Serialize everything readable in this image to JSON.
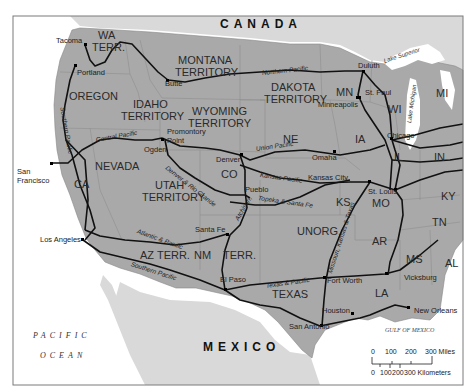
{
  "map": {
    "title": "Railroads of the Western United States",
    "countries": {
      "canada": "CANADA",
      "mexico": "MEXICO"
    },
    "water": {
      "pacific_line1": "PACIFIC",
      "pacific_line2": "OCEAN",
      "gulf": "GULF OF MEXICO",
      "lake_superior": "Lake Superior",
      "lake_michigan": "Lake Michigan"
    },
    "states": {
      "wa": "WA",
      "wa2": "TERR.",
      "montana": "MONTANA",
      "montana2": "TERRITORY",
      "dakota": "DAKOTA",
      "dakota2": "TERRITORY",
      "mn": "MN",
      "wi": "WI",
      "mi": "MI",
      "oregon": "OREGON",
      "idaho": "IDAHO",
      "idaho2": "TERRITORY",
      "wyoming": "WYOMING",
      "wyoming2": "TERRITORY",
      "ne": "NE",
      "ia": "IA",
      "il": "IL",
      "in": "IN",
      "nevada": "NEVADA",
      "ca": "CA",
      "utah": "UTAH",
      "utah2": "TERRITORY",
      "co": "CO",
      "ks": "KS",
      "mo": "MO",
      "ky": "KY",
      "tn": "TN",
      "az": "AZ TERR.",
      "nm": "NM",
      "nm_terr": "TERR.",
      "unorg": "UNORG.",
      "ar": "AR",
      "ms": "MS",
      "al": "AL",
      "texas": "TEXAS",
      "la": "LA"
    },
    "cities": {
      "tacoma": "Tacoma",
      "portland": "Portland",
      "butte": "Butte",
      "duluth": "Duluth",
      "st_paul": "St. Paul",
      "minneapolis": "Minneapolis",
      "chicago": "Chicago",
      "promontory": "Promontory",
      "promontory2": "Point",
      "ogden": "Ogden",
      "san_francisco": "San",
      "san_francisco2": "Francisco",
      "denver": "Denver",
      "omaha": "Omaha",
      "kansas_city": "Kansas City",
      "pueblo": "Pueblo",
      "st_louis": "St. Louis",
      "santa_fe": "Santa Fe",
      "los_angeles": "Los Angeles",
      "el_paso": "El Paso",
      "fort_worth": "Fort Worth",
      "vicksburg": "Vicksburg",
      "houston": "Houston",
      "new_orleans": "New Orleans",
      "san_antonio": "San Antonio"
    },
    "railroads": {
      "northern_pacific": "Northern Pacific",
      "central_pacific": "Central Pacific",
      "union_pacific": "Union Pacific",
      "southern_pacific_north": "Southern Pacific",
      "southern_pacific_south": "Southern Pacific",
      "denver_rio_grande": "Denver & Rio Grande",
      "kansas_pacific": "Kansas Pacific",
      "atchison_topeka": "Atchison, Topeka & Santa Fe",
      "atchison": "Atchison,",
      "topeka": "Topeka & Santa Fe",
      "atlantic_pacific": "Atlantic & Pacific",
      "texas_pacific": "Texas & Pacific",
      "mkt": "Missouri, Kansas & Texas"
    },
    "scale": {
      "miles_ticks": [
        "0",
        "100",
        "200",
        "300 Miles"
      ],
      "km_ticks": [
        "0",
        "100",
        "200",
        "300 Kilometers"
      ]
    },
    "colors": {
      "us_land": "#a9a9a9",
      "foreign_land": "#d9d9d9",
      "water": "#ffffff",
      "railroad": "#111111",
      "border": "#7a7a7a"
    }
  }
}
